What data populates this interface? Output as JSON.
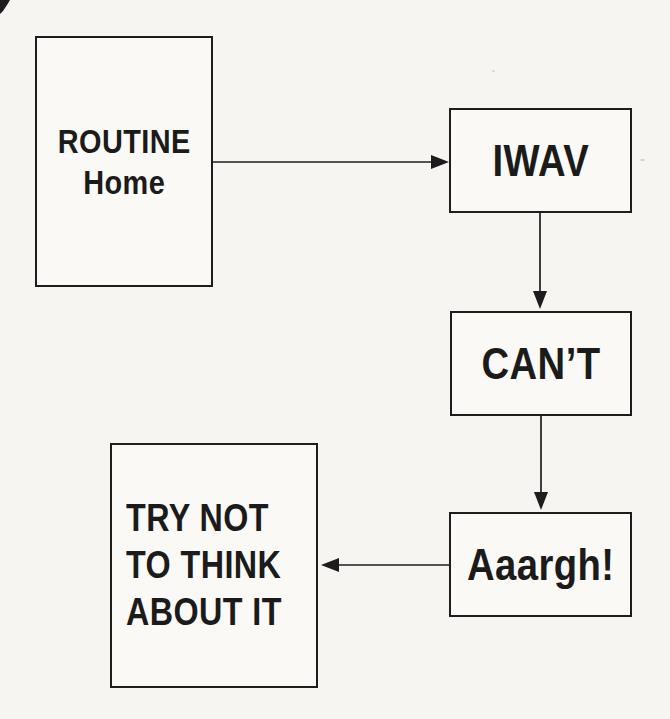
{
  "diagram": {
    "type": "flowchart",
    "colors": {
      "paper": "#f7f5f1",
      "ink": "#1d1d1d",
      "box_fill": "#faf9f5"
    },
    "nodes": {
      "routine_home": {
        "line1": "ROUTINE",
        "line2": "Home"
      },
      "iwav": {
        "label": "IWAV"
      },
      "cant": {
        "label": "CAN’T"
      },
      "aaargh": {
        "label": "Aaargh!"
      },
      "try_not": {
        "line1": "TRY NOT",
        "line2": "TO THINK",
        "line3": "ABOUT IT"
      }
    },
    "edges": [
      {
        "from": "routine_home",
        "to": "iwav",
        "direction": "right"
      },
      {
        "from": "iwav",
        "to": "cant",
        "direction": "down"
      },
      {
        "from": "cant",
        "to": "aaargh",
        "direction": "down"
      },
      {
        "from": "aaargh",
        "to": "try_not",
        "direction": "left"
      }
    ]
  }
}
